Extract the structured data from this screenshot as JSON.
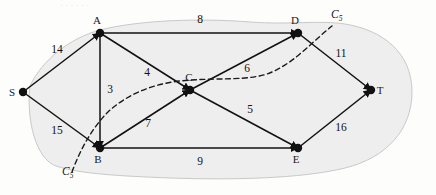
{
  "figure": {
    "type": "flow-network-diagram",
    "width": 436,
    "height": 195,
    "background_color": "#fdfdfc",
    "region_fill": "#eeeeee",
    "region_stroke": "#c9c9c9",
    "edge_color": "#111111",
    "node_color": "#111111",
    "cut_curve_color": "#1a1a1a"
  },
  "nodes": [
    {
      "id": "S",
      "label": "S",
      "x": 23,
      "y": 92,
      "label_dx": -11,
      "label_dy": 4
    },
    {
      "id": "A",
      "label": "A",
      "x": 100,
      "y": 33,
      "label_dx": -3,
      "label_dy": -9
    },
    {
      "id": "B",
      "label": "B",
      "x": 100,
      "y": 148,
      "label_dx": -2,
      "label_dy": 15
    },
    {
      "id": "C",
      "label": "C",
      "x": 190,
      "y": 90,
      "label_dx": -1,
      "label_dy": -9
    },
    {
      "id": "D",
      "label": "D",
      "x": 298,
      "y": 33,
      "label_dx": -3,
      "label_dy": -9
    },
    {
      "id": "E",
      "label": "E",
      "x": 298,
      "y": 148,
      "label_dx": -2,
      "label_dy": 15
    },
    {
      "id": "T",
      "label": "T",
      "x": 371,
      "y": 90,
      "label_dx": 9,
      "label_dy": 4
    }
  ],
  "edges": [
    {
      "from": "S",
      "to": "A",
      "weight": "14",
      "lx": 57,
      "ly": 53
    },
    {
      "from": "S",
      "to": "B",
      "weight": "15",
      "lx": 57,
      "ly": 134
    },
    {
      "from": "A",
      "to": "D",
      "weight": "8",
      "lx": 200,
      "ly": 23
    },
    {
      "from": "A",
      "to": "B",
      "weight": "3",
      "lx": 110,
      "ly": 93
    },
    {
      "from": "A",
      "to": "C",
      "weight": "4",
      "lx": 147,
      "ly": 76
    },
    {
      "from": "B",
      "to": "C",
      "weight": "7",
      "lx": 148,
      "ly": 127
    },
    {
      "from": "B",
      "to": "E",
      "weight": "9",
      "lx": 200,
      "ly": 165
    },
    {
      "from": "C",
      "to": "D",
      "weight": "6",
      "lx": 247,
      "ly": 72
    },
    {
      "from": "C",
      "to": "E",
      "weight": "5",
      "lx": 250,
      "ly": 113
    },
    {
      "from": "D",
      "to": "T",
      "weight": "11",
      "lx": 341,
      "ly": 57
    },
    {
      "from": "E",
      "to": "T",
      "weight": "16",
      "lx": 341,
      "ly": 131
    }
  ],
  "cut": {
    "name": "C5",
    "letter": "C",
    "subscript": "5",
    "labels": [
      {
        "position": "top-right",
        "x": 331,
        "y": 18
      },
      {
        "position": "bottom-left",
        "x": 62,
        "y": 175
      }
    ],
    "source_side": [
      "S",
      "A",
      "B"
    ],
    "sink_side": [
      "C",
      "D",
      "E",
      "T"
    ]
  },
  "artifacts": {
    "top_bleed_text": "·  ·     ·   ·       ·    ·"
  }
}
